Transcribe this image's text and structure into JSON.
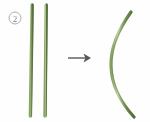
{
  "figure": {
    "panel_label": "2",
    "background_color": "#fefefe",
    "width": 150,
    "height": 122
  },
  "label_marker": {
    "text": "2",
    "style": "circled",
    "circle_stroke_color": "#9a9a9a",
    "text_color": "#8a8a8a",
    "center_x": 15,
    "center_y": 18,
    "radius": 6
  },
  "before_state": {
    "name": "two-straight-stems",
    "count": 2,
    "shape": "straight",
    "items": [
      {
        "name": "stem-left",
        "x_top": 32,
        "y_top": 5,
        "x_bottom": 30,
        "y_bottom": 116,
        "stroke_color": "#6f8b4e",
        "highlight_color": "#b9cd9c",
        "width": 3.2
      },
      {
        "name": "stem-right",
        "x_top": 46,
        "y_top": 5,
        "x_bottom": 45,
        "y_bottom": 116,
        "stroke_color": "#6f8b4e",
        "highlight_color": "#b9cd9c",
        "width": 3.2
      }
    ]
  },
  "transition": {
    "name": "arrow",
    "direction": "right",
    "x_start": 68,
    "x_end": 91,
    "y": 58,
    "color": "#58585a",
    "line_width": 1.4
  },
  "after_state": {
    "name": "one-curved-stem",
    "count": 1,
    "shape": "curved",
    "curvature": "bowed-left",
    "item": {
      "name": "stem-curved",
      "x_top": 131,
      "y_top": 12,
      "x_mid": 111,
      "y_mid": 64,
      "x_bottom": 134,
      "y_bottom": 117,
      "stroke_color": "#6f8b4e",
      "highlight_color": "#b9cd9c",
      "width": 3.0
    }
  },
  "colors": {
    "stem_green_dark": "#5e7a40",
    "stem_green_mid": "#7d9a59",
    "stem_green_light": "#b9cd9c",
    "arrow_gray": "#58585a",
    "label_gray": "#8a8a8a",
    "background": "#fefefe"
  }
}
